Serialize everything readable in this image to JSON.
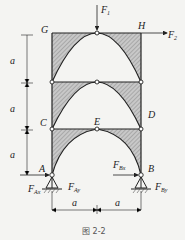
{
  "figure": {
    "caption": "图 2-2",
    "nodes": {
      "G": "G",
      "H": "H",
      "C": "C",
      "D": "D",
      "E": "E",
      "A": "A",
      "B": "B"
    },
    "forces": {
      "F1": {
        "main": "F",
        "sub": "1"
      },
      "F2": {
        "main": "F",
        "sub": "2"
      },
      "FAx": {
        "main": "F",
        "sub": "Ax"
      },
      "FAy": {
        "main": "F",
        "sub": "Ay"
      },
      "FBx": {
        "main": "F",
        "sub": "Bx"
      },
      "FBy": {
        "main": "F",
        "sub": "By"
      }
    },
    "dimensions": {
      "vertical": [
        "a",
        "a",
        "a"
      ],
      "horizontal": [
        "a",
        "a"
      ]
    }
  }
}
